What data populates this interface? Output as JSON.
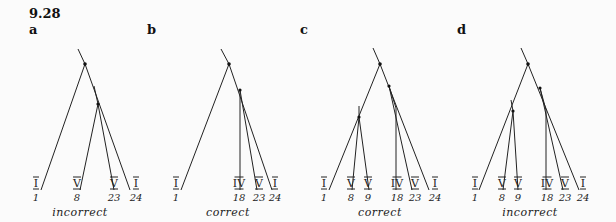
{
  "figure": {
    "number": "9.28",
    "panels": [
      {
        "letter": "a",
        "verdict": "incorrect",
        "root_line": [
          [
            78,
            49
          ],
          [
            85,
            64
          ]
        ],
        "nodes": [
          [
            85,
            64
          ],
          [
            98,
            104
          ]
        ],
        "branches": [
          [
            [
              85,
              64
            ],
            [
              41,
              190
            ]
          ],
          [
            [
              85,
              64
            ],
            [
              130,
              190
            ]
          ],
          [
            [
              94,
              86
            ],
            [
              98,
              104
            ]
          ],
          [
            [
              98,
              104
            ],
            [
              80,
              190
            ]
          ],
          [
            [
              98,
              104
            ],
            [
              114,
              190
            ]
          ]
        ],
        "leaves": [
          {
            "numeral": "I",
            "number": "1",
            "x": 36
          },
          {
            "numeral": "V",
            "number": "8",
            "x": 77
          },
          {
            "numeral": "V",
            "number": "23",
            "x": 114
          },
          {
            "numeral": "I",
            "number": "24",
            "x": 136
          }
        ],
        "letter_x": 29,
        "verdict_x": 80
      },
      {
        "letter": "b",
        "verdict": "correct",
        "root_line": [
          [
            221,
            49
          ],
          [
            229,
            64
          ]
        ],
        "nodes": [
          [
            229,
            64
          ],
          [
            240,
            90
          ]
        ],
        "branches": [
          [
            [
              229,
              64
            ],
            [
              181,
              190
            ]
          ],
          [
            [
              229,
              64
            ],
            [
              272,
              190
            ]
          ],
          [
            [
              240,
              90
            ],
            [
              240,
              190
            ]
          ],
          [
            [
              240,
              90
            ],
            [
              257,
              190
            ]
          ]
        ],
        "leaves": [
          {
            "numeral": "I",
            "number": "1",
            "x": 176
          },
          {
            "numeral": "IV",
            "number": "18",
            "x": 239
          },
          {
            "numeral": "V",
            "number": "23",
            "x": 259
          },
          {
            "numeral": "I",
            "number": "24",
            "x": 275
          }
        ],
        "letter_x": 147,
        "verdict_x": 228
      },
      {
        "letter": "c",
        "verdict": "correct",
        "root_line": [
          [
            373,
            48
          ],
          [
            380,
            64
          ]
        ],
        "nodes": [
          [
            380,
            64
          ],
          [
            359,
            117
          ],
          [
            389,
            86
          ]
        ],
        "branches": [
          [
            [
              380,
              64
            ],
            [
              329,
              190
            ]
          ],
          [
            [
              359,
              106
            ],
            [
              359,
              117
            ]
          ],
          [
            [
              359,
              117
            ],
            [
              352,
              190
            ]
          ],
          [
            [
              359,
              117
            ],
            [
              369,
              190
            ]
          ],
          [
            [
              380,
              64
            ],
            [
              429,
              190
            ]
          ],
          [
            [
              389,
              86
            ],
            [
              396,
              108
            ]
          ],
          [
            [
              396,
              108
            ],
            [
              396,
              190
            ]
          ],
          [
            [
              389,
              86
            ],
            [
              412,
              190
            ]
          ]
        ],
        "leaves": [
          {
            "numeral": "I",
            "number": "1",
            "x": 324
          },
          {
            "numeral": "V",
            "number": "8",
            "x": 351
          },
          {
            "numeral": "V",
            "number": "9",
            "x": 368
          },
          {
            "numeral": "IV",
            "number": "18",
            "x": 397
          },
          {
            "numeral": "V",
            "number": "23",
            "x": 415
          },
          {
            "numeral": "I",
            "number": "24",
            "x": 435
          }
        ],
        "letter_x": 300,
        "verdict_x": 380
      },
      {
        "letter": "d",
        "verdict": "incorrect",
        "root_line": [
          [
            521,
            48
          ],
          [
            528,
            64
          ]
        ],
        "nodes": [
          [
            528,
            64
          ],
          [
            513,
            111
          ],
          [
            540,
            88
          ]
        ],
        "branches": [
          [
            [
              528,
              64
            ],
            [
              479,
              190
            ]
          ],
          [
            [
              511,
              100
            ],
            [
              513,
              111
            ]
          ],
          [
            [
              513,
              111
            ],
            [
              503,
              190
            ]
          ],
          [
            [
              513,
              111
            ],
            [
              518,
              190
            ]
          ],
          [
            [
              528,
              64
            ],
            [
              579,
              190
            ]
          ],
          [
            [
              540,
              88
            ],
            [
              546,
              110
            ]
          ],
          [
            [
              546,
              110
            ],
            [
              546,
              190
            ]
          ],
          [
            [
              540,
              88
            ],
            [
              563,
              190
            ]
          ]
        ],
        "leaves": [
          {
            "numeral": "I",
            "number": "1",
            "x": 475
          },
          {
            "numeral": "V",
            "number": "8",
            "x": 502
          },
          {
            "numeral": "V",
            "number": "9",
            "x": 518
          },
          {
            "numeral": "IV",
            "number": "18",
            "x": 547
          },
          {
            "numeral": "V",
            "number": "23",
            "x": 565
          },
          {
            "numeral": "I",
            "number": "24",
            "x": 583
          }
        ],
        "letter_x": 457,
        "verdict_x": 530
      }
    ]
  }
}
